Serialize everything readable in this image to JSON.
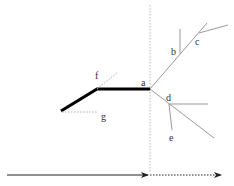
{
  "diagram": {
    "labels": {
      "a": "a",
      "b": "b",
      "c": "c",
      "d": "d",
      "e": "e",
      "f": "f",
      "g": "g"
    },
    "colors": {
      "thick_line": "#000000",
      "thin_line": "#9a9a9a",
      "dotted_line": "#b0b0b0",
      "arrow": "#222222",
      "text": "#333333"
    }
  }
}
